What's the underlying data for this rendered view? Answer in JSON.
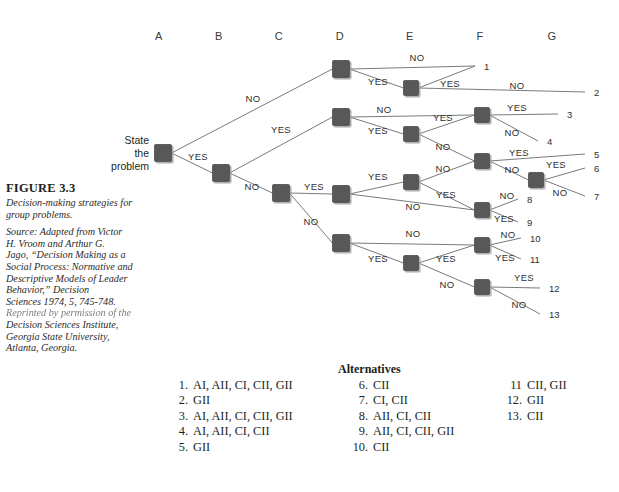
{
  "figure": {
    "number": "FIGURE 3.3",
    "title": "Decision-making strategies for group problems.",
    "source_line_1": "Source: Adapted from Victor",
    "source_line_2": "H. Vroom and Arthur G.",
    "source_line_3": "Jago, “Decision Making as a",
    "source_line_4": "Social Process: Normative and",
    "source_line_5": "Descriptive Models of Leader",
    "source_line_6": "Behavior,” Decision",
    "source_line_7": "Sciences 1974, 5, 745-748.",
    "source_line_8": "Reprinted by permission of the",
    "source_line_9": "Decision Sciences Institute,",
    "source_line_10": "Georgia State University,",
    "source_line_11": "Atlanta, Georgia."
  },
  "columns": [
    {
      "label": "A",
      "x": 159
    },
    {
      "label": "B",
      "x": 219
    },
    {
      "label": "C",
      "x": 279
    },
    {
      "label": "D",
      "x": 340
    },
    {
      "label": "E",
      "x": 410
    },
    {
      "label": "F",
      "x": 480
    },
    {
      "label": "G",
      "x": 552
    }
  ],
  "root_label": {
    "line1": "State",
    "line2": "the",
    "line3": "problem"
  },
  "colors": {
    "node_fill": "#585858",
    "node_stroke": "#3f3f3f",
    "node_shadow": "#b9b9b9",
    "line": "#7a7a7a",
    "text": "#231f20",
    "label_text": "#2f2f2f",
    "background": "#ffffff"
  },
  "chart_data": {
    "type": "diagram",
    "diagram_type": "decision-tree",
    "title": "Decision-making strategies for group problems.",
    "columns": [
      "A",
      "B",
      "C",
      "D",
      "E",
      "F",
      "G"
    ],
    "branch_labels": [
      "YES",
      "NO"
    ],
    "nodes": [
      {
        "id": "A",
        "col": "A",
        "x": 163,
        "y": 153,
        "size": 17
      },
      {
        "id": "B",
        "col": "B",
        "x": 221,
        "y": 173,
        "size": 17
      },
      {
        "id": "C",
        "col": "C",
        "x": 281,
        "y": 193,
        "size": 17
      },
      {
        "id": "D1",
        "col": "D",
        "x": 341,
        "y": 69,
        "size": 17
      },
      {
        "id": "D2",
        "col": "D",
        "x": 341,
        "y": 117,
        "size": 17
      },
      {
        "id": "D3",
        "col": "D",
        "x": 341,
        "y": 194,
        "size": 17
      },
      {
        "id": "D4",
        "col": "D",
        "x": 341,
        "y": 243,
        "size": 17
      },
      {
        "id": "E1",
        "col": "E",
        "x": 411,
        "y": 88,
        "size": 15
      },
      {
        "id": "E2",
        "col": "E",
        "x": 411,
        "y": 134,
        "size": 15
      },
      {
        "id": "E3",
        "col": "E",
        "x": 411,
        "y": 182,
        "size": 15
      },
      {
        "id": "E4",
        "col": "E",
        "x": 411,
        "y": 263,
        "size": 15
      },
      {
        "id": "F1",
        "col": "F",
        "x": 482,
        "y": 115,
        "size": 15
      },
      {
        "id": "F2",
        "col": "F",
        "x": 482,
        "y": 161,
        "size": 15
      },
      {
        "id": "F3",
        "col": "F",
        "x": 482,
        "y": 210,
        "size": 15
      },
      {
        "id": "F4",
        "col": "F",
        "x": 482,
        "y": 245,
        "size": 15
      },
      {
        "id": "F5",
        "col": "F",
        "x": 482,
        "y": 287,
        "size": 15
      },
      {
        "id": "G1",
        "col": "G",
        "x": 536,
        "y": 180,
        "size": 15
      }
    ],
    "edges": [
      {
        "from": "A",
        "to": "D1",
        "label": "NO",
        "lx": 253,
        "ly": 102
      },
      {
        "from": "A",
        "to": "B",
        "label": "YES",
        "lx": 198,
        "ly": 160
      },
      {
        "from": "B",
        "to": "D2",
        "label": "YES",
        "lx": 281,
        "ly": 133
      },
      {
        "from": "B",
        "to": "C",
        "label": "NO",
        "lx": 252,
        "ly": 190
      },
      {
        "from": "C",
        "to": "D3",
        "label": "YES",
        "lx": 314,
        "ly": 190
      },
      {
        "from": "C",
        "to": "D4",
        "label": "NO",
        "lx": 311,
        "ly": 225
      },
      {
        "from": "D1",
        "to": "out1",
        "label": "NO",
        "lx": 417,
        "ly": 61
      },
      {
        "from": "D1",
        "to": "E1",
        "label": "YES",
        "lx": 378,
        "ly": 85
      },
      {
        "from": "E1",
        "to": "out1",
        "label": "YES",
        "lx": 450,
        "ly": 87
      },
      {
        "from": "E1",
        "to": "out2",
        "label": "NO",
        "lx": 517,
        "ly": 89
      },
      {
        "from": "D2",
        "to": "F1",
        "label": "NO",
        "lx": 384,
        "ly": 113
      },
      {
        "from": "D2",
        "to": "E2",
        "label": "YES",
        "lx": 378,
        "ly": 134
      },
      {
        "from": "E2",
        "to": "F1",
        "label": "YES",
        "lx": 443,
        "ly": 121
      },
      {
        "from": "E2",
        "to": "F2",
        "label": "NO",
        "lx": 443,
        "ly": 150
      },
      {
        "from": "F1",
        "to": "out3",
        "label": "YES",
        "lx": 517,
        "ly": 111
      },
      {
        "from": "F1",
        "to": "out4",
        "label": "NO",
        "lx": 512,
        "ly": 136
      },
      {
        "from": "F2",
        "to": "out5",
        "label": "YES",
        "lx": 519,
        "ly": 156
      },
      {
        "from": "F2",
        "to": "G1",
        "label": "NO",
        "lx": 512,
        "ly": 173
      },
      {
        "from": "G1",
        "to": "out6",
        "label": "YES",
        "lx": 556,
        "ly": 168
      },
      {
        "from": "G1",
        "to": "out7",
        "label": "NO",
        "lx": 560,
        "ly": 196
      },
      {
        "from": "D3",
        "to": "E3",
        "label": "YES",
        "lx": 378,
        "ly": 180
      },
      {
        "from": "D3",
        "to": "F3",
        "label": "NO",
        "lx": 413,
        "ly": 210
      },
      {
        "from": "E3",
        "to": "F2",
        "label": "NO",
        "lx": 443,
        "ly": 172
      },
      {
        "from": "E3",
        "to": "F3",
        "label": "YES",
        "lx": 446,
        "ly": 198
      },
      {
        "from": "F3",
        "to": "out8",
        "label": "NO",
        "lx": 507,
        "ly": 199
      },
      {
        "from": "F3",
        "to": "out9",
        "label": "YES",
        "lx": 504,
        "ly": 222
      },
      {
        "from": "D4",
        "to": "F4",
        "label": "NO",
        "lx": 413,
        "ly": 237
      },
      {
        "from": "D4",
        "to": "E4",
        "label": "YES",
        "lx": 378,
        "ly": 262
      },
      {
        "from": "E4",
        "to": "F4",
        "label": "YES",
        "lx": 446,
        "ly": 262
      },
      {
        "from": "E4",
        "to": "F5",
        "label": "NO",
        "lx": 447,
        "ly": 288
      },
      {
        "from": "F4",
        "to": "out10",
        "label": "NO",
        "lx": 508,
        "ly": 238
      },
      {
        "from": "F4",
        "to": "out11",
        "label": "YES",
        "lx": 505,
        "ly": 261
      },
      {
        "from": "F5",
        "to": "out12",
        "label": "YES",
        "lx": 524,
        "ly": 281
      },
      {
        "from": "F5",
        "to": "out13",
        "label": "NO",
        "lx": 519,
        "ly": 308
      }
    ],
    "outcomes": [
      {
        "id": "out1",
        "label": "1",
        "x": 484,
        "y": 66
      },
      {
        "id": "out2",
        "label": "2",
        "x": 594,
        "y": 92
      },
      {
        "id": "out3",
        "label": "3",
        "x": 567,
        "y": 114
      },
      {
        "id": "out4",
        "label": "4",
        "x": 547,
        "y": 141
      },
      {
        "id": "out5",
        "label": "5",
        "x": 594,
        "y": 154
      },
      {
        "id": "out6",
        "label": "6",
        "x": 594,
        "y": 168
      },
      {
        "id": "out7",
        "label": "7",
        "x": 594,
        "y": 196
      },
      {
        "id": "out8",
        "label": "8",
        "x": 527,
        "y": 199
      },
      {
        "id": "out9",
        "label": "9",
        "x": 527,
        "y": 222
      },
      {
        "id": "out10",
        "label": "10",
        "x": 530,
        "y": 238
      },
      {
        "id": "out11",
        "label": "11",
        "x": 530,
        "y": 259
      },
      {
        "id": "out12",
        "label": "12",
        "x": 549,
        "y": 288
      },
      {
        "id": "out13",
        "label": "13",
        "x": 549,
        "y": 314
      }
    ]
  },
  "alternatives": {
    "heading": "Alternatives",
    "column1": [
      {
        "num": "1.",
        "text": "AI, AII, CI, CII, GII"
      },
      {
        "num": "2.",
        "text": "GII"
      },
      {
        "num": "3.",
        "text": "AI, AII, CI, CII, GII"
      },
      {
        "num": "4.",
        "text": "AI, AII, CI, CII"
      },
      {
        "num": "5.",
        "text": "GII"
      }
    ],
    "column2": [
      {
        "num": "6.",
        "text": "CII"
      },
      {
        "num": "7.",
        "text": "CI, CII"
      },
      {
        "num": "8.",
        "text": "AII, CI, CII"
      },
      {
        "num": "9.",
        "text": "AII, CI, CII, GII"
      },
      {
        "num": "10.",
        "text": "CII"
      }
    ],
    "column3": [
      {
        "num": "11",
        "text": "CII, GII"
      },
      {
        "num": "12.",
        "text": "GII"
      },
      {
        "num": "13.",
        "text": "CII"
      }
    ]
  }
}
